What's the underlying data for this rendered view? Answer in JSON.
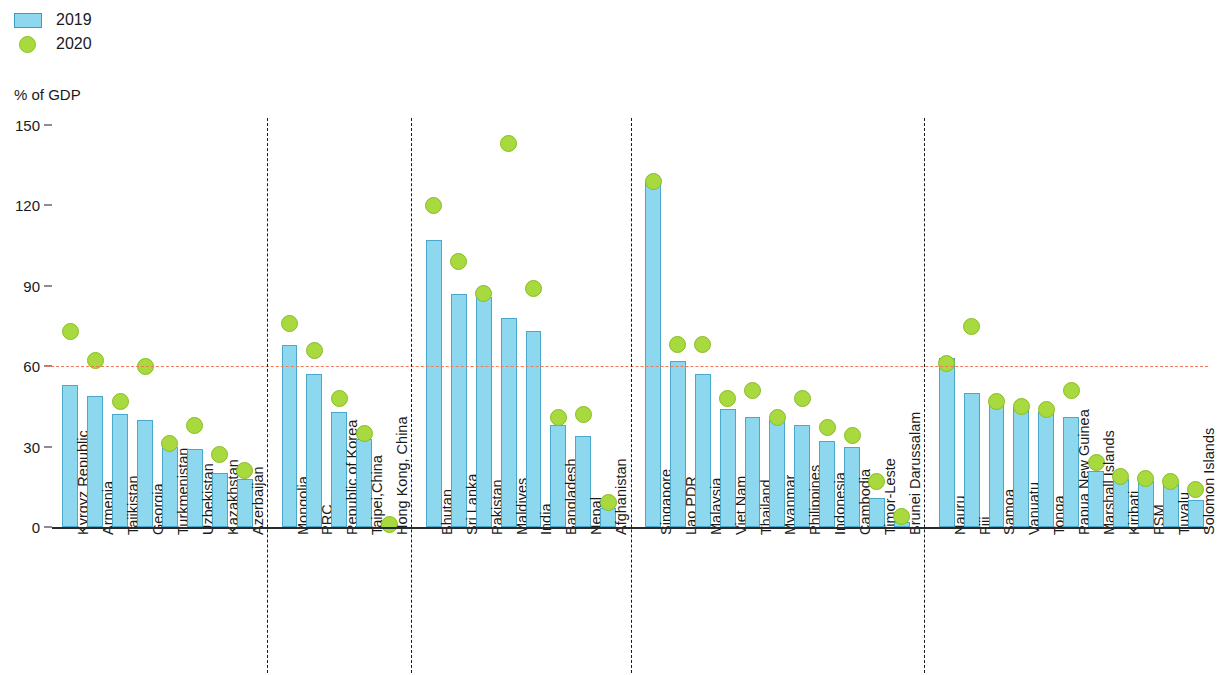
{
  "legend": {
    "items": [
      {
        "label": "2019",
        "marker": "bar-swatch",
        "color": "#8ed8ef"
      },
      {
        "label": "2020",
        "marker": "dot-swatch",
        "color": "#a8d93e"
      }
    ]
  },
  "axis": {
    "unit_label": "% of GDP",
    "y_ticks": [
      "0",
      "30",
      "60",
      "90",
      "120",
      "150"
    ]
  },
  "chart_data": {
    "type": "bar",
    "title": "",
    "subtitle": "",
    "xlabel": "",
    "ylabel": "% of GDP",
    "ylim": [
      0,
      150
    ],
    "yticks": [
      0,
      30,
      60,
      90,
      120,
      150
    ],
    "grid": false,
    "legend_position": "top-left",
    "reference_line": {
      "value": 60,
      "color": "#f07a5a",
      "style": "dashed"
    },
    "group_separators": "dashed vertical lines between subregions",
    "series": [
      {
        "name": "2019",
        "type": "bar",
        "color": "#8ed8ef"
      },
      {
        "name": "2020",
        "type": "dot",
        "color": "#a8d93e"
      }
    ],
    "groups": [
      {
        "name": "Central and West Asia",
        "categories": [
          "Kyrgyz Republic",
          "Armenia",
          "Tajikistan",
          "Georgia",
          "Turkmenistan",
          "Uzbekistan",
          "Kazakhstan",
          "Azerbaijan"
        ],
        "values_2019": [
          53,
          49,
          42,
          40,
          30,
          29,
          20,
          18
        ],
        "values_2020": [
          73,
          62,
          47,
          60,
          31,
          38,
          27,
          21
        ]
      },
      {
        "name": "East Asia",
        "categories": [
          "Mongolia",
          "PRC",
          "Republic of Korea",
          "Taipei,China",
          "Hong Kong, China"
        ],
        "values_2019": [
          68,
          57,
          43,
          33,
          0.3
        ],
        "values_2020": [
          76,
          66,
          48,
          35,
          1
        ]
      },
      {
        "name": "South Asia",
        "categories": [
          "Bhutan",
          "Sri Lanka",
          "Pakistan",
          "Maldives",
          "India",
          "Bangladesh",
          "Nepal",
          "Afghanistan"
        ],
        "values_2019": [
          107,
          87,
          86,
          78,
          73,
          38,
          34,
          7
        ],
        "values_2020": [
          120,
          99,
          87,
          143,
          89,
          41,
          42,
          9
        ]
      },
      {
        "name": "Southeast Asia",
        "categories": [
          "Singapore",
          "Lao PDR",
          "Malaysia",
          "Viet Nam",
          "Thailand",
          "Myanmar",
          "Philippines",
          "Indonesia",
          "Cambodia",
          "Timor-Leste",
          "Brunei Darussalam"
        ],
        "values_2019": [
          129,
          62,
          57,
          44,
          41,
          40,
          38,
          32,
          30,
          11,
          2
        ],
        "values_2020": [
          129,
          68,
          68,
          48,
          51,
          41,
          48,
          37,
          34,
          17,
          4
        ]
      },
      {
        "name": "The Pacific",
        "categories": [
          "Nauru",
          "Fiji",
          "Samoa",
          "Vanuatu",
          "Tonga",
          "Papua New Guinea",
          "Marshall Islands",
          "Kiribati",
          "FSM",
          "Tuvalu",
          "Solomon Islands"
        ],
        "values_2019": [
          63,
          50,
          46,
          45,
          43,
          41,
          21,
          18,
          17,
          16,
          10
        ],
        "values_2020": [
          61,
          75,
          47,
          45,
          44,
          51,
          24,
          19,
          18,
          17,
          14
        ]
      }
    ]
  }
}
